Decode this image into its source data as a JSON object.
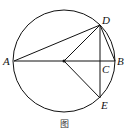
{
  "figure": {
    "caption": "图",
    "circle": {
      "cx": 64,
      "cy": 61,
      "r": 51
    },
    "points": {
      "A": {
        "x": 14,
        "y": 61,
        "label": "A"
      },
      "B": {
        "x": 115,
        "y": 61,
        "label": "B"
      },
      "C": {
        "x": 100,
        "y": 61,
        "label": "C"
      },
      "D": {
        "x": 100,
        "y": 25,
        "label": "D"
      },
      "E": {
        "x": 100,
        "y": 98,
        "label": "E"
      },
      "O": {
        "x": 64,
        "y": 61,
        "label": ""
      }
    },
    "segments": [
      "AB",
      "AD",
      "DE",
      "DB",
      "OD",
      "OE"
    ]
  }
}
